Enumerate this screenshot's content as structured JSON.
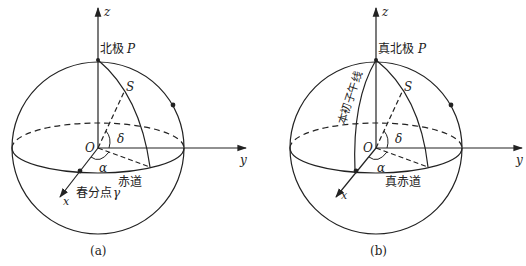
{
  "panels": [
    {
      "id": "a",
      "caption": "(a)",
      "pole_label": "北极",
      "pole_symbol": "P",
      "star_label": "S",
      "origin_label": "O",
      "declination_label": "δ",
      "right_ascension_label": "α",
      "equator_label": "赤道",
      "equinox_label": "春分点",
      "equinox_symbol": "γ",
      "axes": {
        "x": "x",
        "y": "y",
        "z": "z"
      }
    },
    {
      "id": "b",
      "caption": "(b)",
      "pole_label": "真北极",
      "pole_symbol": "P",
      "star_label": "S",
      "origin_label": "O",
      "declination_label": "δ",
      "right_ascension_label": "α",
      "equator_label": "真赤道",
      "meridian_label": "本初子午线",
      "axes": {
        "x": "x",
        "y": "y",
        "z": "z"
      }
    }
  ],
  "colors": {
    "line": "#222222",
    "background": "#ffffff"
  }
}
